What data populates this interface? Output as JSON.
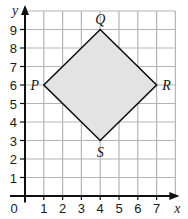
{
  "diagram": {
    "type": "coordinate-grid",
    "x_axis": {
      "label": "x",
      "min": 0,
      "max": 8,
      "ticks": [
        1,
        2,
        3,
        4,
        5,
        6,
        7
      ]
    },
    "y_axis": {
      "label": "y",
      "min": 0,
      "max": 10,
      "ticks": [
        1,
        2,
        3,
        4,
        5,
        6,
        7,
        8,
        9
      ]
    },
    "origin_label": "0",
    "shape": {
      "name": "PQRS",
      "fill": "#e3e3e3",
      "stroke": "#111111",
      "vertices": [
        {
          "label": "P",
          "x": 1,
          "y": 6,
          "anchor": "left"
        },
        {
          "label": "Q",
          "x": 4,
          "y": 9,
          "anchor": "top"
        },
        {
          "label": "R",
          "x": 7,
          "y": 6,
          "anchor": "right"
        },
        {
          "label": "S",
          "x": 4,
          "y": 3,
          "anchor": "bottom"
        }
      ]
    },
    "colors": {
      "grid": "#b5b5b5",
      "axis": "#111111"
    }
  }
}
